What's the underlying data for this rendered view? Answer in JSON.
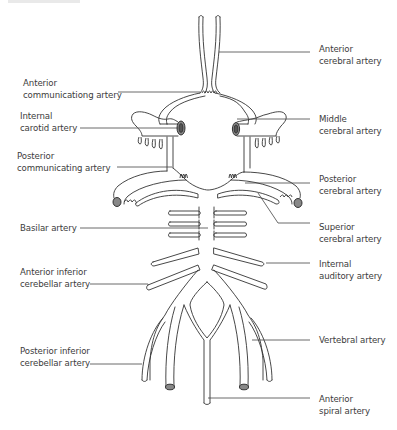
{
  "diagram": {
    "stroke_color": "#333333",
    "background": "#ffffff",
    "labels_left": [
      {
        "id": "anterior-communicating-artery",
        "line1": "Anterior",
        "line2": "communicationg artery"
      },
      {
        "id": "internal-carotid-artery",
        "line1": "Internal",
        "line2": "carotid artery"
      },
      {
        "id": "posterior-communicating-artery",
        "line1": "Posterior",
        "line2": "communicating artery"
      },
      {
        "id": "basilar-artery",
        "line1": "Basilar artery",
        "line2": ""
      },
      {
        "id": "anterior-inferior-cerebellar-artery",
        "line1": "Anterior inferior",
        "line2": "cerebellar artery"
      },
      {
        "id": "posterior-inferior-cerebellar-artery",
        "line1": "Posterior inferior",
        "line2": "cerebellar artery"
      }
    ],
    "labels_right": [
      {
        "id": "anterior-cerebral-artery",
        "line1": "Anterior",
        "line2": "cerebral artery"
      },
      {
        "id": "middle-cerebral-artery",
        "line1": "Middle",
        "line2": "cerebral artery"
      },
      {
        "id": "posterior-cerebral-artery",
        "line1": "Posterior",
        "line2": "cerebral artery"
      },
      {
        "id": "superior-cerebral-artery",
        "line1": "Superior",
        "line2": "cerebral artery"
      },
      {
        "id": "internal-auditory-artery",
        "line1": "Internal",
        "line2": "auditory artery"
      },
      {
        "id": "vertebral-artery",
        "line1": "Vertebral artery",
        "line2": ""
      },
      {
        "id": "anterior-spiral-artery",
        "line1": "Anterior",
        "line2": "spiral artery"
      }
    ]
  }
}
